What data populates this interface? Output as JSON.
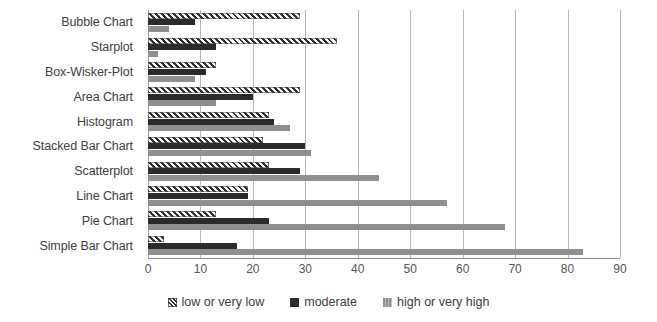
{
  "chart_data": {
    "type": "bar",
    "orientation": "horizontal",
    "title": "",
    "subtitle": "",
    "xlabel": "",
    "ylabel": "",
    "xlim": [
      0,
      90
    ],
    "xticks": [
      0,
      10,
      20,
      30,
      40,
      50,
      60,
      70,
      80,
      90
    ],
    "xtick_labels": [
      "0",
      "10",
      "20",
      "30",
      "40",
      "50",
      "60",
      "70",
      "80",
      "90"
    ],
    "grid": true,
    "grid_axis": "x",
    "legend_position": "bottom-center",
    "categories": [
      "Bubble Chart",
      "Starplot",
      "Box-Wisker-Plot",
      "Area Chart",
      "Histogram",
      "Stacked Bar Chart",
      "Scatterplot",
      "Line Chart",
      "Pie Chart",
      "Simple Bar Chart"
    ],
    "series": [
      {
        "name": "low or very low",
        "color": "#2f2f2f",
        "pattern": "diagonal-hatch",
        "values": [
          29,
          36,
          13,
          29,
          23,
          22,
          23,
          19,
          13,
          3
        ]
      },
      {
        "name": "moderate",
        "color": "#2b2b2b",
        "pattern": "solid",
        "values": [
          9,
          13,
          11,
          20,
          24,
          30,
          29,
          19,
          23,
          17
        ]
      },
      {
        "name": "high or very high",
        "color": "#8f8f8f",
        "pattern": "solid",
        "values": [
          4,
          2,
          9,
          13,
          27,
          31,
          44,
          57,
          68,
          83
        ]
      }
    ]
  },
  "legend": {
    "items": [
      {
        "label": "low or very low"
      },
      {
        "label": "moderate"
      },
      {
        "label": "high or very high"
      }
    ]
  }
}
